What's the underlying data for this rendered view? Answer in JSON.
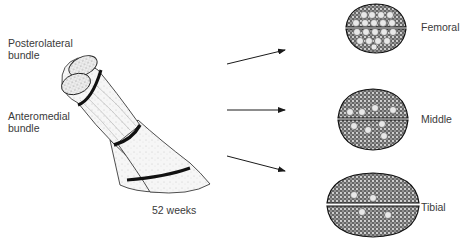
{
  "labels": {
    "posterolateral": [
      "Posterolateral",
      "bundle"
    ],
    "anteromedial": [
      "Anteromedial",
      "bundle"
    ],
    "time": "52 weeks"
  },
  "sections": [
    {
      "name": "Femoral"
    },
    {
      "name": "Middle"
    },
    {
      "name": "Tibial"
    }
  ],
  "colors": {
    "ink": "#1a1a1a",
    "fill": "#f2f2f2",
    "bg": "#ffffff"
  }
}
